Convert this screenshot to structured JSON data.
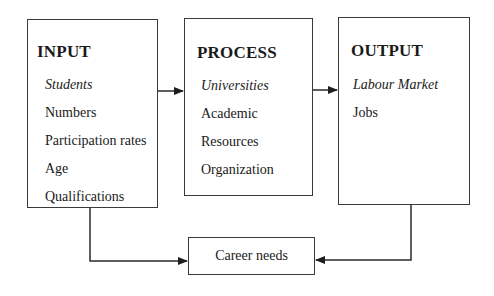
{
  "input": {
    "title": "INPUT",
    "items": [
      {
        "label": "Students",
        "italic": true
      },
      {
        "label": "Numbers",
        "italic": false
      },
      {
        "label": "Participation rates",
        "italic": false
      },
      {
        "label": "Age",
        "italic": false
      },
      {
        "label": "Qualifications",
        "italic": false
      }
    ]
  },
  "process": {
    "title": "PROCESS",
    "items": [
      {
        "label": "Universities",
        "italic": true
      },
      {
        "label": "Academic",
        "italic": false
      },
      {
        "label": "Resources",
        "italic": false
      },
      {
        "label": "Organization",
        "italic": false
      }
    ]
  },
  "output": {
    "title": "OUTPUT",
    "items": [
      {
        "label": "Labour Market",
        "italic": true
      },
      {
        "label": "Jobs",
        "italic": false
      }
    ]
  },
  "career": {
    "label": "Career needs"
  },
  "colors": {
    "line": "#2a2a2a",
    "border": "#3a3a3a",
    "text": "#1a1a1a"
  }
}
